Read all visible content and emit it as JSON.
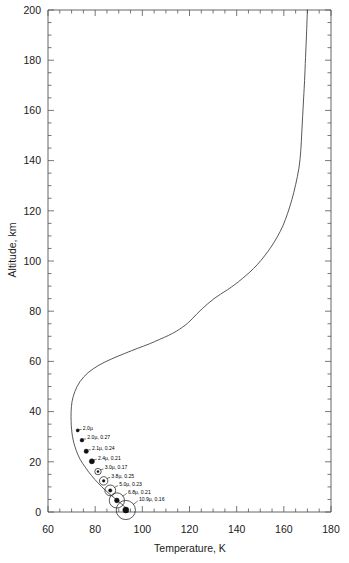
{
  "chart_data": {
    "type": "line",
    "title": "",
    "xlabel": "Temperature, K",
    "ylabel": "Altitude, km",
    "xlim": [
      60,
      180
    ],
    "ylim": [
      0,
      200
    ],
    "xticks": [
      60,
      80,
      100,
      120,
      140,
      160,
      180
    ],
    "yticks": [
      0,
      20,
      40,
      60,
      80,
      100,
      120,
      140,
      160,
      180,
      200
    ],
    "xtick_labels": [
      "60",
      "80",
      "100",
      "120",
      "140",
      "160",
      "180"
    ],
    "ytick_labels": [
      "0",
      "20",
      "40",
      "60",
      "80",
      "100",
      "120",
      "140",
      "160",
      "180",
      "200"
    ],
    "x_minor_tick_step": 5,
    "y_minor_tick_step": 5,
    "grid": false,
    "legend": null,
    "series": [
      {
        "name": "Temperature profile",
        "x": [
          93.8,
          93.4,
          92.6,
          91.2,
          89.4,
          87.6,
          85.8,
          84.2,
          82.6,
          81.2,
          79.8,
          78.4,
          77.2,
          76.0,
          74.8,
          73.6,
          72.6,
          71.8,
          71.0,
          70.4,
          70.0,
          69.8,
          69.8,
          70.2,
          71.4,
          73.6,
          77.0,
          81.6,
          87.0,
          92.6,
          98.0,
          103.0,
          107.4,
          111.2,
          114.4,
          117.0,
          119.2,
          121.2,
          123.2,
          125.4,
          127.8,
          130.4,
          133.2,
          136.2,
          139.2,
          142.4,
          145.6,
          148.8,
          151.8,
          154.6,
          157.2,
          159.6,
          161.6,
          163.4,
          165.0,
          166.4,
          167.2,
          167.6,
          168.0,
          168.4,
          168.8,
          169.2,
          169.6,
          170.0
        ],
        "y": [
          0.0,
          1.0,
          2.0,
          3.2,
          4.6,
          6.0,
          7.4,
          8.8,
          10.2,
          11.6,
          13.0,
          14.6,
          16.0,
          17.6,
          19.2,
          21.0,
          23.0,
          25.0,
          27.4,
          30.0,
          33.0,
          36.0,
          40.0,
          44.0,
          48.0,
          52.0,
          55.5,
          58.5,
          61.0,
          63.2,
          65.2,
          67.0,
          68.8,
          70.4,
          72.0,
          73.6,
          75.2,
          77.0,
          79.0,
          81.0,
          83.0,
          85.0,
          86.8,
          88.6,
          90.6,
          93.0,
          95.6,
          98.6,
          102.0,
          105.6,
          109.6,
          114.0,
          119.0,
          124.4,
          130.4,
          137.0,
          144.0,
          151.0,
          158.0,
          165.0,
          172.0,
          181.0,
          190.0,
          200.0
        ]
      }
    ],
    "annotations": [
      {
        "label": "2.0µ",
        "temperature": 72.6,
        "altitude": 32.5,
        "marker": "dot",
        "marker_size": 1.6
      },
      {
        "label": "2.0µ, 0.27",
        "temperature": 74.4,
        "altitude": 28.6,
        "marker": "dot",
        "marker_size": 1.9
      },
      {
        "label": "2.1µ, 0.24",
        "temperature": 76.2,
        "altitude": 24.2,
        "marker": "dot",
        "marker_size": 2.2
      },
      {
        "label": "2.4µ, 0.21",
        "temperature": 78.6,
        "altitude": 20.2,
        "marker": "dot",
        "marker_size": 2.6
      },
      {
        "label": "3.0µ, 0.17",
        "temperature": 81.2,
        "altitude": 16.1,
        "marker": "ring",
        "marker_size": 3.2
      },
      {
        "label": "3.8µ, 0.25",
        "temperature": 83.6,
        "altitude": 12.4,
        "marker": "ring",
        "marker_size": 4.2
      },
      {
        "label": "5.0µ, 0.23",
        "temperature": 86.4,
        "altitude": 8.6,
        "marker": "ring",
        "marker_size": 5.4
      },
      {
        "label": "6.8µ, 0.21",
        "temperature": 89.2,
        "altitude": 4.6,
        "marker": "ring",
        "marker_size": 7.6
      },
      {
        "label": "10.9µ, 0.16",
        "temperature": 93.0,
        "altitude": 0.8,
        "marker": "ring",
        "marker_size": 9.6
      }
    ]
  },
  "figure": {
    "background_color": "#ffffff",
    "curve_color": "#3a3a3a",
    "axis_color": "#555555",
    "text_color": "#1a1a1a"
  }
}
